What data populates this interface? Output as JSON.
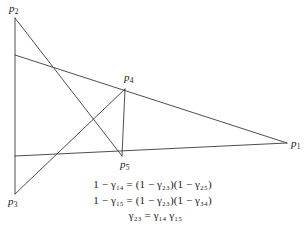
{
  "figure": {
    "type": "geometric-line-diagram",
    "background_color": "#ffffff",
    "line_color": "#3a3a3a",
    "points": [
      {
        "id": "p1",
        "label": "p",
        "sub": "1",
        "x": 287,
        "y": 143,
        "label_x": 291,
        "label_y": 138
      },
      {
        "id": "p2",
        "label": "p",
        "sub": "2",
        "x": 15,
        "y": 18,
        "label_x": 9,
        "label_y": 3
      },
      {
        "id": "p3",
        "label": "p",
        "sub": "3",
        "x": 15,
        "y": 194,
        "label_x": 8,
        "label_y": 196
      },
      {
        "id": "p4",
        "label": "p",
        "sub": "4",
        "x": 125,
        "y": 89,
        "label_x": 124,
        "label_y": 72
      },
      {
        "id": "p5",
        "label": "p",
        "sub": "5",
        "x": 122,
        "y": 156,
        "label_x": 120,
        "label_y": 159
      }
    ],
    "segments": [
      {
        "name": "segment-p2-p3",
        "x1": 15,
        "y1": 18,
        "x2": 15,
        "y2": 194
      },
      {
        "name": "segment-p2-p5",
        "x1": 15,
        "y1": 18,
        "x2": 122,
        "y2": 156
      },
      {
        "name": "segment-left-to-p1",
        "x1": 15,
        "y1": 55,
        "x2": 287,
        "y2": 143
      },
      {
        "name": "segment-p3-p4",
        "x1": 15,
        "y1": 194,
        "x2": 125,
        "y2": 89
      },
      {
        "name": "segment-p4-p5",
        "x1": 125,
        "y1": 89,
        "x2": 122,
        "y2": 156
      },
      {
        "name": "segment-base-to-p1",
        "x1": 15,
        "y1": 156,
        "x2": 287,
        "y2": 143
      }
    ]
  },
  "equations": {
    "line1": "1 − γ₁₄ = (1 − γ₂₃)(1 − γ₂₅)",
    "line2": "1 − γ₁₅ = (1 − γ₂₃)(1 − γ₃₄)",
    "line3": "γ₂₃ = γ₁₄  γ₁₅"
  }
}
